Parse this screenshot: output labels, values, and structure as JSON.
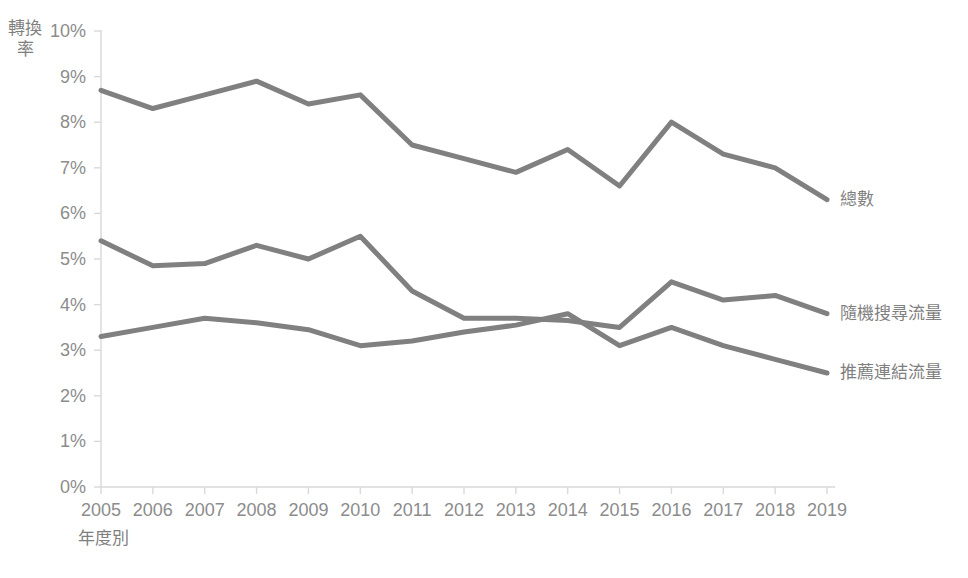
{
  "chart_data": {
    "type": "line",
    "title": "",
    "xlabel": "年度別",
    "ylabel": "轉換率",
    "categories": [
      "2005",
      "2006",
      "2007",
      "2008",
      "2009",
      "2010",
      "2011",
      "2012",
      "2013",
      "2014",
      "2015",
      "2016",
      "2017",
      "2018",
      "2019"
    ],
    "ylim": [
      0,
      10
    ],
    "ytick_labels": [
      "0%",
      "1%",
      "2%",
      "3%",
      "4%",
      "5%",
      "6%",
      "7%",
      "8%",
      "9%",
      "10%"
    ],
    "ytick_values": [
      0,
      1,
      2,
      3,
      4,
      5,
      6,
      7,
      8,
      9,
      10
    ],
    "y_unit": "%",
    "grid": false,
    "legend_position": "right-inline-end-of-line",
    "series": [
      {
        "name": "總數",
        "color": "#808080",
        "values": [
          8.7,
          8.3,
          8.6,
          8.9,
          8.4,
          8.6,
          7.5,
          7.2,
          6.9,
          7.4,
          6.6,
          8.0,
          7.3,
          7.0,
          6.3
        ]
      },
      {
        "name": "隨機搜尋流量",
        "color": "#808080",
        "values": [
          5.4,
          4.85,
          4.9,
          5.3,
          5.0,
          5.5,
          4.3,
          3.7,
          3.7,
          3.65,
          3.5,
          4.5,
          4.1,
          4.2,
          3.8
        ]
      },
      {
        "name": "推薦連結流量",
        "color": "#808080",
        "values": [
          3.3,
          3.5,
          3.7,
          3.6,
          3.45,
          3.1,
          3.2,
          3.4,
          3.55,
          3.8,
          3.1,
          3.5,
          3.1,
          2.8,
          2.5
        ]
      }
    ]
  },
  "axis": {
    "line_color": "#d9d9d9",
    "tick_color": "#d9d9d9"
  }
}
